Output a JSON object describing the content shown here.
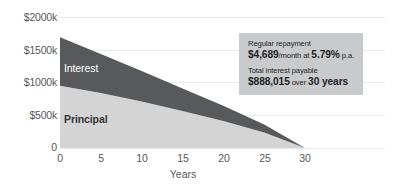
{
  "chart_data": {
    "type": "area",
    "title": "",
    "subtitle": "",
    "xlabel": "Years",
    "ylabel": "",
    "stacked": true,
    "grid": true,
    "legend_position": "inline-labels",
    "xlim": [
      0,
      30
    ],
    "ylim": [
      0,
      2000
    ],
    "x_ticks": [
      "0",
      "5",
      "10",
      "15",
      "20",
      "25",
      "30"
    ],
    "x_tick_values": [
      0,
      5,
      10,
      15,
      20,
      25,
      30
    ],
    "y_ticks": [
      "0",
      "$500k",
      "$1000k",
      "$1500k",
      "$2000k"
    ],
    "y_tick_values": [
      0,
      500,
      1000,
      1500,
      2000
    ],
    "x": [
      0,
      5,
      10,
      15,
      20,
      25,
      30
    ],
    "series": [
      {
        "name": "Principal",
        "color": "#d4d4d4",
        "values": [
          950,
          840,
          710,
          565,
          410,
          235,
          0
        ]
      },
      {
        "name": "Interest",
        "color": "#58595b",
        "values": [
          740,
          595,
          465,
          345,
          235,
          125,
          0
        ]
      }
    ],
    "totals": [
      1690,
      1435,
      1175,
      910,
      645,
      360,
      0
    ],
    "annotations": [
      {
        "name": "interest-area-label",
        "text": "Interest"
      },
      {
        "name": "principal-area-label",
        "text": "Principal"
      }
    ]
  },
  "axes": {
    "x_title": "Years",
    "x_ticks": [
      "0",
      "5",
      "10",
      "15",
      "20",
      "25",
      "30"
    ],
    "y_ticks": [
      "0",
      "$500k",
      "$1000k",
      "$1500k",
      "$2000k"
    ]
  },
  "labels": {
    "interest": "Interest",
    "principal": "Principal"
  },
  "callout": {
    "repayment_caption": "Regular repayment",
    "repayment_amount": "$4,689",
    "repayment_per": "/month at ",
    "repayment_rate": "5.79%",
    "repayment_rate_suffix": " p.a.",
    "interest_caption": "Total interest payable",
    "interest_amount": "$888,015",
    "interest_over": " over ",
    "interest_term": "30 years"
  },
  "colors": {
    "interest": "#58595b",
    "principal": "#d4d4d4",
    "callout_background": "#c9cacc",
    "grid": "#e8e9ea",
    "text": "#56575a"
  }
}
